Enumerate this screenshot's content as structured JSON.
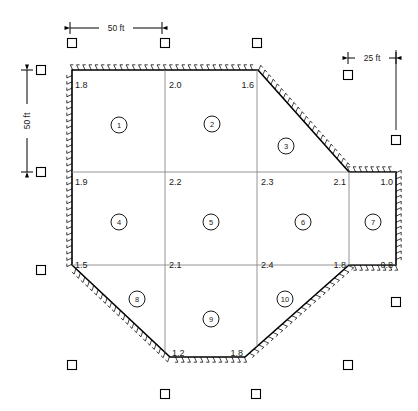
{
  "figure": {
    "type": "earthwork-grid-plan",
    "units": "ft"
  },
  "dimensions": [
    {
      "name": "top-horizontal",
      "label": "50 ft",
      "x1": 70,
      "x2": 162,
      "y": 28,
      "orientation": "horizontal"
    },
    {
      "name": "left-vertical",
      "label": "50 ft",
      "y1": 70,
      "y2": 172,
      "x": 27,
      "orientation": "vertical"
    },
    {
      "name": "right-horizontal",
      "label": "25 ft",
      "x1": 348,
      "x2": 396,
      "y": 58,
      "orientation": "horizontal"
    }
  ],
  "elevations": [
    {
      "id": "e-r0-c0",
      "value": "1.8",
      "x": 75,
      "y": 88,
      "anchor": "start"
    },
    {
      "id": "e-r0-c1",
      "value": "2.0",
      "x": 169,
      "y": 88,
      "anchor": "start"
    },
    {
      "id": "e-r0-c2",
      "value": "1.6",
      "x": 254,
      "y": 88,
      "anchor": "end"
    },
    {
      "id": "e-r1-c0",
      "value": "1.9",
      "x": 75,
      "y": 185,
      "anchor": "start"
    },
    {
      "id": "e-r1-c1",
      "value": "2.2",
      "x": 169,
      "y": 185,
      "anchor": "start"
    },
    {
      "id": "e-r1-c2",
      "value": "2.3",
      "x": 261,
      "y": 185,
      "anchor": "start"
    },
    {
      "id": "e-r1-c3",
      "value": "2.1",
      "x": 346,
      "y": 185,
      "anchor": "end"
    },
    {
      "id": "e-r1-c4",
      "value": "1.0",
      "x": 393,
      "y": 185,
      "anchor": "end"
    },
    {
      "id": "e-r2-c0",
      "value": "1.5",
      "x": 75,
      "y": 268,
      "anchor": "start"
    },
    {
      "id": "e-r2-c1",
      "value": "2.1",
      "x": 169,
      "y": 268,
      "anchor": "start"
    },
    {
      "id": "e-r2-c2",
      "value": "2.4",
      "x": 261,
      "y": 268,
      "anchor": "start"
    },
    {
      "id": "e-r2-c3",
      "value": "1.8",
      "x": 346,
      "y": 268,
      "anchor": "end"
    },
    {
      "id": "e-r2-c4",
      "value": "0.8",
      "x": 393,
      "y": 268,
      "anchor": "end"
    },
    {
      "id": "e-r3-c1",
      "value": "1.2",
      "x": 172,
      "y": 356,
      "anchor": "start"
    },
    {
      "id": "e-r3-c2",
      "value": "1.8",
      "x": 243,
      "y": 356,
      "anchor": "end"
    }
  ],
  "cells": [
    {
      "id": 1,
      "label": "1",
      "cx": 119,
      "cy": 125
    },
    {
      "id": 2,
      "label": "2",
      "cx": 212,
      "cy": 124
    },
    {
      "id": 3,
      "label": "3",
      "cx": 286,
      "cy": 146
    },
    {
      "id": 4,
      "label": "4",
      "cx": 119,
      "cy": 222
    },
    {
      "id": 5,
      "label": "5",
      "cx": 211,
      "cy": 222
    },
    {
      "id": 6,
      "label": "6",
      "cx": 303,
      "cy": 222
    },
    {
      "id": 7,
      "label": "7",
      "cx": 373,
      "cy": 222
    },
    {
      "id": 8,
      "label": "8",
      "cx": 137,
      "cy": 299
    },
    {
      "id": 9,
      "label": "9",
      "cx": 211,
      "cy": 319
    },
    {
      "id": 10,
      "label": "10",
      "cx": 285,
      "cy": 299
    }
  ],
  "markers": [
    {
      "id": "m-top-1",
      "x": 72,
      "y": 43
    },
    {
      "id": "m-top-2",
      "x": 165,
      "y": 43
    },
    {
      "id": "m-top-3",
      "x": 257,
      "y": 43
    },
    {
      "id": "m-top-4",
      "x": 348,
      "y": 75
    },
    {
      "id": "m-left-1",
      "x": 41,
      "y": 70
    },
    {
      "id": "m-left-2",
      "x": 41,
      "y": 172
    },
    {
      "id": "m-left-3",
      "x": 41,
      "y": 270
    },
    {
      "id": "m-right-1",
      "x": 396,
      "y": 140
    },
    {
      "id": "m-right-2",
      "x": 396,
      "y": 302
    },
    {
      "id": "m-bot-1",
      "x": 72,
      "y": 365
    },
    {
      "id": "m-bot-2",
      "x": 348,
      "y": 365
    },
    {
      "id": "m-bot-3",
      "x": 165,
      "y": 394
    },
    {
      "id": "m-bot-4",
      "x": 256,
      "y": 394
    }
  ],
  "boundary": {
    "points": "72,70 258,70 349,172 396,172 396,265 349,265 245,357 170,357 72,265",
    "vertices": [
      {
        "name": "nw",
        "x": 72,
        "y": 70
      },
      {
        "name": "n-ne",
        "x": 258,
        "y": 70
      },
      {
        "name": "ne-notch",
        "x": 349,
        "y": 172
      },
      {
        "name": "e-top",
        "x": 396,
        "y": 172
      },
      {
        "name": "e-bot",
        "x": 396,
        "y": 265
      },
      {
        "name": "se-notch",
        "x": 349,
        "y": 265
      },
      {
        "name": "s-se",
        "x": 245,
        "y": 357
      },
      {
        "name": "s-sw",
        "x": 170,
        "y": 357
      },
      {
        "name": "sw",
        "x": 72,
        "y": 265
      }
    ]
  },
  "gridlines": {
    "vertical": [
      {
        "name": "v1",
        "x": 165,
        "y1": 70,
        "y2": 357
      },
      {
        "name": "v2",
        "x": 257,
        "y1": 70,
        "y2": 357
      },
      {
        "name": "v3",
        "x": 349,
        "y1": 172,
        "y2": 265
      }
    ],
    "horizontal": [
      {
        "name": "h1",
        "y": 172,
        "x1": 72,
        "x2": 396
      },
      {
        "name": "h2",
        "y": 265,
        "x1": 72,
        "x2": 396
      }
    ]
  },
  "colors": {
    "line": "#000000",
    "grid": "#888888",
    "text": "#1a1a1a",
    "background": "#ffffff"
  }
}
